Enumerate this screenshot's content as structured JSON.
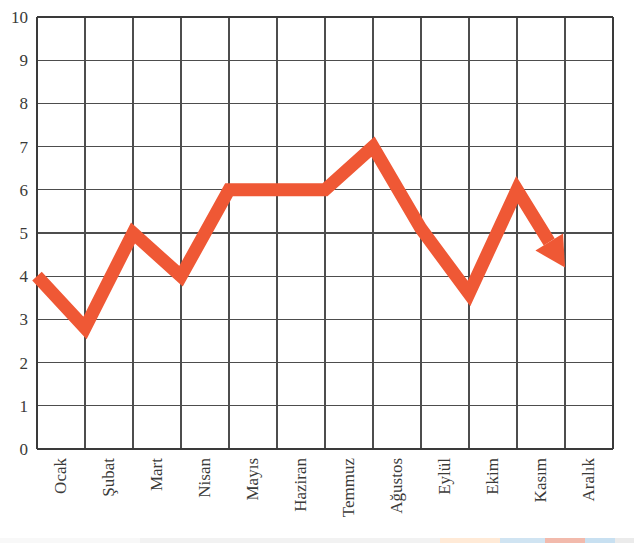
{
  "chart_data": {
    "type": "line",
    "title": "",
    "xlabel": "",
    "ylabel": "",
    "categories": [
      "Ocak",
      "Şubat",
      "Mart",
      "Nisan",
      "Mayıs",
      "Haziran",
      "Temmuz",
      "Ağustos",
      "Eylül",
      "Ekim",
      "Kasım",
      "Aralık"
    ],
    "values": [
      4,
      2.8,
      5,
      4,
      6,
      6,
      6,
      7,
      5.1,
      3.6,
      6,
      4.2
    ],
    "series": [
      {
        "name": "seri-1",
        "values": [
          4,
          2.8,
          5,
          4,
          6,
          6,
          6,
          7,
          5.1,
          3.6,
          6,
          4.2
        ],
        "color": "#EF5835",
        "line_width": 13,
        "end_marker": "arrowhead"
      }
    ],
    "ylim": [
      0,
      10
    ],
    "ytick_labels": [
      "0",
      "1",
      "2",
      "3",
      "4",
      "5",
      "6",
      "7",
      "8",
      "9",
      "10"
    ],
    "ytick_values": [
      0,
      1,
      2,
      3,
      4,
      5,
      6,
      7,
      8,
      9,
      10
    ],
    "grid": true,
    "grid_horizontal": true,
    "grid_vertical": true,
    "grid_color": "#4d4d4d",
    "legend": false,
    "legend_position": "none",
    "xtick_rotation": -90,
    "background": "#ffffff",
    "annotations": [
      {
        "text": "arrow at end of line pointing down-right",
        "at_category": "Aralık"
      }
    ]
  },
  "colors": {
    "series": "#EF5835",
    "grid": "#4d4d4d",
    "axis": "#3a3a3a",
    "tick_text": "#3a3a38",
    "background": "#ffffff"
  },
  "bottom_strip": {
    "segments": [
      {
        "color": "#f3f3f3",
        "left": 0,
        "width": 140
      },
      {
        "color": "#e9e9e9",
        "left": 140,
        "width": 300
      },
      {
        "color": "#ffd9b8",
        "left": 440,
        "width": 60
      },
      {
        "color": "#aacfe8",
        "left": 500,
        "width": 45
      },
      {
        "color": "#e8836a",
        "left": 545,
        "width": 40
      },
      {
        "color": "#9cc7e6",
        "left": 585,
        "width": 30
      },
      {
        "color": "#dcdcdc",
        "left": 615,
        "width": 19
      }
    ]
  }
}
